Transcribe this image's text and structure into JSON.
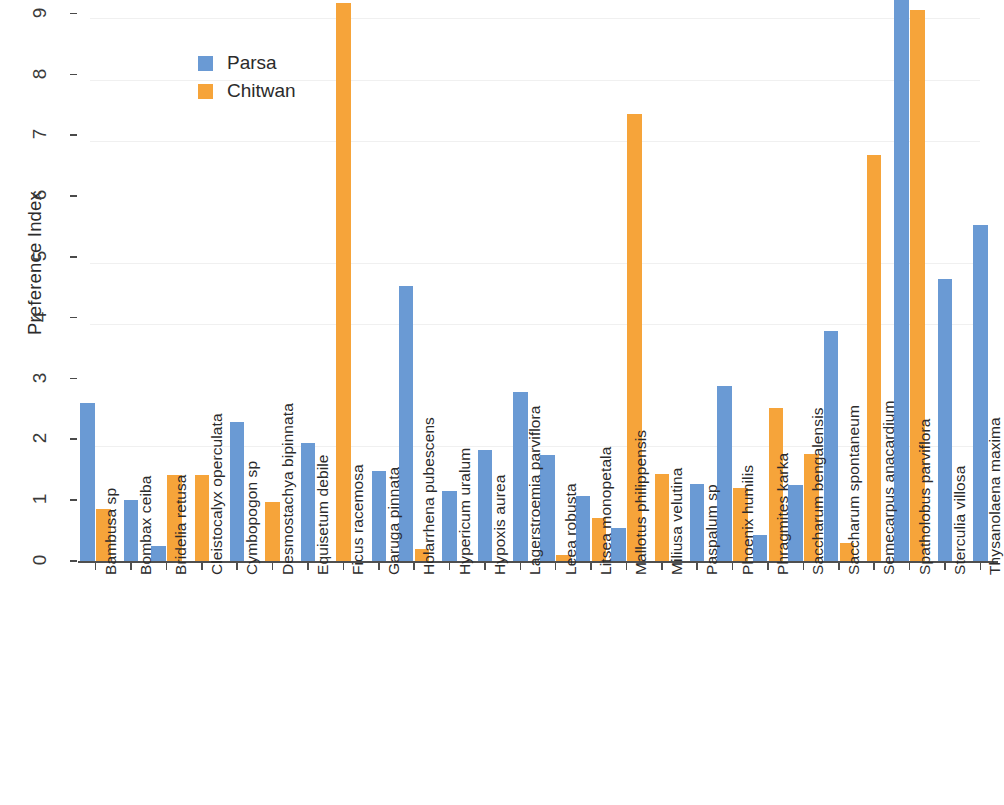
{
  "chart_data": {
    "type": "bar",
    "title": "",
    "xlabel": "",
    "ylabel": "Preference Index",
    "ylim": [
      0,
      9.3
    ],
    "yticks": [
      0,
      1,
      2,
      3,
      4,
      5,
      6,
      7,
      8,
      9
    ],
    "ytick_labels": [
      "0",
      "1",
      "2",
      "3",
      "4",
      "5",
      "6",
      "7",
      "8",
      "9"
    ],
    "grid": false,
    "legend_position": "upper-left-inside",
    "colors": {
      "Parsa": "#6a9ad4",
      "Chitwan": "#f6a43a"
    },
    "categories": [
      "Bambusa sp",
      "Bombax ceiba",
      "Bridelia retusa",
      "Cleistocalyx operculata",
      "Cymbopogon sp",
      "Desmostachya bipinnata",
      "Equisetum debile",
      "Ficus racemosa",
      "Garuga pinnata",
      "Holarrhena pubescens",
      "Hypericum uralum",
      "Hypoxis aurea",
      "Lagerstroemia parviflora",
      "Leea robusta",
      "Litsea monopetala",
      "Mallotus philippensis",
      "Miliusa velutina",
      "Paspalum sp",
      "Phoenix humilis",
      "Phragmites karka",
      "Saccharum bengalensis",
      "Saccharum spontaneum",
      "Semecarpus anacardium",
      "Spatholobus parviflora",
      "Sterculia villosa",
      "Thysanolaena maxima"
    ],
    "series": [
      {
        "name": "Parsa",
        "color": "#6a9ad4",
        "values": [
          2.62,
          1.02,
          0.26,
          0,
          2.3,
          0,
          1.95,
          0,
          1.49,
          4.54,
          1.17,
          1.84,
          2.79,
          1.76,
          1.09,
          0.56,
          0,
          1.28,
          2.9,
          0.45,
          1.27,
          3.8,
          0,
          9.25,
          4.65,
          5.55
        ]
      },
      {
        "name": "Chitwan",
        "color": "#f6a43a",
        "values": [
          0.87,
          0,
          1.43,
          1.43,
          0,
          0.98,
          0,
          9.2,
          0,
          0.21,
          0,
          0,
          0,
          0.12,
          0.72,
          7.37,
          1.45,
          0,
          1.22,
          2.53,
          1.78,
          0.31,
          6.7,
          9.08,
          0,
          0
        ]
      }
    ]
  },
  "legend": {
    "items": [
      {
        "label": "Parsa",
        "swatch": "parsa"
      },
      {
        "label": "Chitwan",
        "swatch": "chitwan"
      }
    ]
  },
  "axes": {
    "y_title": "Preference Index"
  }
}
